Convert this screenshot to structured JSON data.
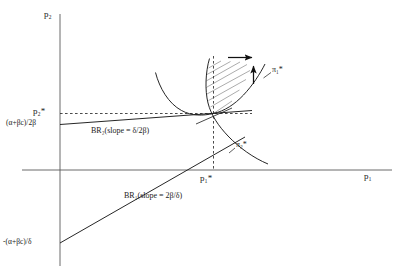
{
  "figure": {
    "background": "#ffffff",
    "line_color": "#1a1a1a",
    "hatch_color": "#8a8a8a",
    "axes": {
      "x_axis_label": "p",
      "x_axis_label_sub": "1",
      "y_axis_label": "p",
      "y_axis_label_sub": "2",
      "origin_x": 60,
      "origin_y": 170
    },
    "labels": {
      "y_axis": "p₂",
      "x_axis": "p₁",
      "p2_star": "p₂*",
      "p1_star": "p₁*",
      "y_intercept_br2": "(α+βc)/2β",
      "y_intercept_br1": "-(α+βc)/δ",
      "br2": "BR₂(slope = δ/2β)",
      "br1": "BR₁(slope = 2β/δ)",
      "pi1_star": "π₁*",
      "pi2_star": "π₂*"
    },
    "annotations": [
      {
        "name": "right-arrow",
        "direction": "right",
        "meaning": "increasing firm 1 profit"
      },
      {
        "name": "up-arrow",
        "direction": "up",
        "meaning": "increasing firm 2 profit"
      },
      {
        "name": "hatched-lens",
        "meaning": "region of mutual improvement over Nash equilibrium"
      }
    ],
    "curves": [
      {
        "name": "br1-line",
        "label": "BR₁(slope = 2β/δ)",
        "type": "straight-line",
        "slope_text": "2β/δ"
      },
      {
        "name": "br2-line",
        "label": "BR₂(slope = δ/2β)",
        "type": "straight-line",
        "slope_text": "δ/2β"
      },
      {
        "name": "pi1-isoprofit",
        "label": "π₁*",
        "type": "convex-curve"
      },
      {
        "name": "pi2-isoprofit",
        "label": "π₂*",
        "type": "convex-curve"
      }
    ]
  }
}
